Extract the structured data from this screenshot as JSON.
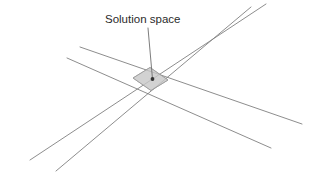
{
  "figure": {
    "name": "solution-space-diagram",
    "background_color": "#ffffff",
    "width": 318,
    "height": 172,
    "annotation": {
      "label": "Solution space",
      "text_x": 105,
      "text_y": 23,
      "leader": {
        "x1": 148,
        "y1": 28,
        "x2": 152.5,
        "y2": 79
      },
      "text_color": "#2b2b2b"
    },
    "line_color": "#808080",
    "region": {
      "name": "solution-space-region",
      "fill_color": "#cfcfcf",
      "stroke_color": "#9a9a9a",
      "points": "133,78 150,67.5 168,80 151,90.5"
    },
    "vertex_marker": {
      "cx": 152.5,
      "cy": 79,
      "r": 1.9,
      "color": "#333333"
    },
    "lines": [
      {
        "id": "line-a",
        "label": "constraint-line-ascending-upper",
        "x1": 30,
        "y1": 160,
        "x2": 266,
        "y2": 4
      },
      {
        "id": "line-b",
        "label": "constraint-line-ascending-lower",
        "x1": 56,
        "y1": 171,
        "x2": 251,
        "y2": 7
      },
      {
        "id": "line-c",
        "label": "constraint-line-descending-upper",
        "x1": 80,
        "y1": 47,
        "x2": 302,
        "y2": 124
      },
      {
        "id": "line-d",
        "label": "constraint-line-descending-lower",
        "x1": 67,
        "y1": 58,
        "x2": 271,
        "y2": 148
      }
    ]
  }
}
